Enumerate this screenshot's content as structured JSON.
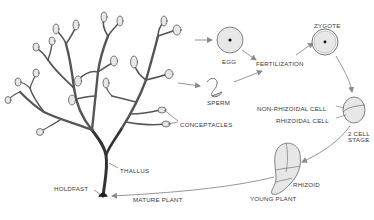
{
  "diagram": {
    "type": "life-cycle",
    "colors": {
      "ink": "#3a3a3a",
      "arrow": "#8a8a8a",
      "background": "#ffffff"
    },
    "labels": {
      "egg": "EGG",
      "zygote": "ZYGOTE",
      "fertilization": "FERTILIZATION",
      "sperm": "SPERM",
      "non_rhizoidal_cell": "NON-RHIZOIDAL CELL",
      "rhizoidal_cell": "RHIZOIDAL CELL",
      "two_cell_stage_line1": "2 CELL",
      "two_cell_stage_line2": "STAGE",
      "conceptacles": "CONCEPTACLES",
      "thallus": "THALLUS",
      "holdfast": "HOLDFAST",
      "mature_plant": "MATURE PLANT",
      "rhizoid": "RHIZOID",
      "young_plant": "YOUNG PLANT"
    },
    "nodes": [
      {
        "id": "mature-plant",
        "label": "MATURE PLANT"
      },
      {
        "id": "egg",
        "label": "EGG"
      },
      {
        "id": "sperm",
        "label": "SPERM"
      },
      {
        "id": "fertilization",
        "label": "FERTILIZATION"
      },
      {
        "id": "zygote",
        "label": "ZYGOTE"
      },
      {
        "id": "two-cell-stage",
        "label": "2 CELL STAGE"
      },
      {
        "id": "young-plant",
        "label": "YOUNG PLANT"
      }
    ],
    "edges": [
      {
        "from": "mature-plant",
        "to": "egg"
      },
      {
        "from": "mature-plant",
        "to": "sperm"
      },
      {
        "from": "egg",
        "to": "fertilization"
      },
      {
        "from": "sperm",
        "to": "fertilization"
      },
      {
        "from": "fertilization",
        "to": "zygote"
      },
      {
        "from": "zygote",
        "to": "two-cell-stage"
      },
      {
        "from": "two-cell-stage",
        "to": "young-plant"
      },
      {
        "from": "young-plant",
        "to": "mature-plant"
      }
    ]
  }
}
